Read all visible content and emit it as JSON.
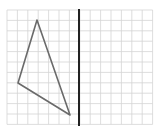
{
  "diagram": {
    "type": "grid-symmetry-exercise",
    "grid": {
      "origin_x": 7,
      "origin_y": 10,
      "cell": 10.4,
      "cols": 14,
      "rows": 11,
      "line_color": "#d4d4d4"
    },
    "axis": {
      "x": 79,
      "y1": 9,
      "y2": 126,
      "color": "#222222",
      "width": 2
    },
    "triangle": {
      "points": [
        [
          37,
          20
        ],
        [
          18,
          83
        ],
        [
          70,
          115
        ]
      ],
      "stroke": "#6a6a6a",
      "width": 1.6
    }
  }
}
